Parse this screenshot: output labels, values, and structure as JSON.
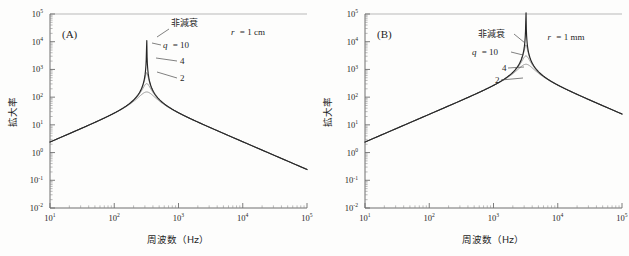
{
  "figure": {
    "background": "#fdfdfc",
    "axis_color": "#6e6e6e",
    "undamped_color": "#262626",
    "damped_color": "#8a8a8a"
  },
  "panels": [
    {
      "tag": "(A)",
      "condition": "r = 1 cm",
      "condition_var": "r",
      "condition_rest": "= 1 cm",
      "peak_label": "非減衰",
      "q_label": "q",
      "q_eq": "= 10",
      "q_values": [
        "10",
        "4",
        "2"
      ],
      "label_side": "right"
    },
    {
      "tag": "(B)",
      "condition": "r = 1 mm",
      "condition_var": "r",
      "condition_rest": "= 1 mm",
      "peak_label": "非減衰",
      "q_label": "q",
      "q_eq": "= 10",
      "q_values": [
        "10",
        "4",
        "2"
      ],
      "label_side": "left"
    }
  ],
  "axes": {
    "xlabel": "周波数（Hz）",
    "ylabel": "拡大率",
    "x_ticks": [
      "1",
      "2",
      "3",
      "4",
      "5"
    ],
    "y_ticks": [
      "5",
      "4",
      "3",
      "2",
      "1",
      "0",
      "-1",
      "-2"
    ],
    "mantissa": "10"
  },
  "chart_data": {
    "type": "line",
    "title": "",
    "xlabel": "周波数（Hz）",
    "ylabel": "拡大率",
    "xscale": "log",
    "yscale": "log",
    "xlim": [
      10,
      100000
    ],
    "ylim": [
      0.01,
      100000
    ],
    "xtick_exponents": [
      1,
      2,
      3,
      4,
      5
    ],
    "ytick_exponents": [
      5,
      4,
      3,
      2,
      1,
      0,
      -1,
      -2
    ],
    "grid": false,
    "legend": "inline-annotations",
    "panels": [
      {
        "name": "(A)",
        "annotation": "r = 1 cm",
        "resonance_hz": 320,
        "low_freq_slope_decades_per_decade": 1.0,
        "high_freq_slope_decades_per_decade": -1.0,
        "value_at_10hz": 2.4,
        "value_at_100000hz": 2.4,
        "series": [
          {
            "name": "非減衰",
            "q": null,
            "peak_value": 18000,
            "color": "#262626",
            "x": [
              10,
              31.6,
              100,
              200,
              280,
              310,
              320,
              330,
              360,
              500,
              1000,
              3160,
              10000,
              31600,
              100000
            ],
            "y": [
              2.4,
              7.6,
              26,
              58,
              150,
              700,
              18000,
              700,
              150,
              58,
              26,
              7.6,
              2.4,
              0.76,
              0.24
            ]
          },
          {
            "name": "q = 10",
            "q": 10,
            "peak_value": 1700,
            "color": "#6f6f6f",
            "x": [
              10,
              31.6,
              100,
              200,
              280,
              310,
              320,
              330,
              360,
              500,
              1000,
              3160,
              10000,
              31600,
              100000
            ],
            "y": [
              2.4,
              7.6,
              26,
              58,
              140,
              500,
              1700,
              500,
              140,
              58,
              26,
              7.6,
              2.4,
              0.76,
              0.24
            ]
          },
          {
            "name": "4",
            "q": 4,
            "peak_value": 330,
            "color": "#8a8a8a",
            "x": [
              10,
              31.6,
              100,
              200,
              280,
              310,
              320,
              330,
              360,
              500,
              1000,
              3160,
              10000,
              31600,
              100000
            ],
            "y": [
              2.4,
              7.6,
              26,
              57,
              125,
              250,
              330,
              250,
              125,
              57,
              26,
              7.6,
              2.4,
              0.76,
              0.24
            ]
          },
          {
            "name": "2",
            "q": 2,
            "peak_value": 120,
            "color": "#9a9a9a",
            "x": [
              10,
              31.6,
              100,
              200,
              280,
              310,
              320,
              330,
              360,
              500,
              1000,
              3160,
              10000,
              31600,
              100000
            ],
            "y": [
              2.4,
              7.6,
              26,
              55,
              100,
              115,
              120,
              115,
              100,
              55,
              26,
              7.6,
              2.4,
              0.76,
              0.24
            ]
          }
        ]
      },
      {
        "name": "(B)",
        "annotation": "r = 1 mm",
        "resonance_hz": 3200,
        "low_freq_slope_decades_per_decade": 1.0,
        "high_freq_slope_decades_per_decade": -1.0,
        "value_at_10hz": 2.4,
        "value_at_100000hz": 2.4,
        "series": [
          {
            "name": "非減衰",
            "q": null,
            "peak_value": 18000,
            "color": "#262626",
            "x": [
              10,
              100,
              1000,
              2000,
              2800,
              3100,
              3200,
              3300,
              3600,
              5000,
              10000,
              31600,
              100000
            ],
            "y": [
              2.4,
              24,
              240,
              560,
              1500,
              7000,
              18000,
              7000,
              1500,
              560,
              240,
              76,
              24
            ]
          },
          {
            "name": "q = 10",
            "q": 10,
            "peak_value": 1700,
            "color": "#6f6f6f",
            "x": [
              10,
              100,
              1000,
              2000,
              2800,
              3100,
              3200,
              3300,
              3600,
              5000,
              10000,
              31600,
              100000
            ],
            "y": [
              2.4,
              24,
              240,
              550,
              1300,
              1600,
              1700,
              1600,
              1300,
              550,
              240,
              76,
              24
            ]
          },
          {
            "name": "4",
            "q": 4,
            "peak_value": 330,
            "color": "#8a8a8a",
            "x": [
              10,
              100,
              1000,
              2000,
              2800,
              3100,
              3200,
              3300,
              3600,
              5000,
              10000,
              31600,
              100000
            ],
            "y": [
              2.4,
              24,
              235,
              420,
              310,
              325,
              330,
              325,
              310,
              420,
              235,
              76,
              24
            ]
          },
          {
            "name": "2",
            "q": 2,
            "peak_value": 120,
            "color": "#9a9a9a",
            "x": [
              10,
              100,
              1000,
              2000,
              2800,
              3100,
              3200,
              3300,
              3600,
              5000,
              10000,
              31600,
              100000
            ],
            "y": [
              2.4,
              24,
              150,
              120,
              115,
              118,
              120,
              118,
              115,
              120,
              150,
              76,
              24
            ]
          }
        ]
      }
    ]
  }
}
